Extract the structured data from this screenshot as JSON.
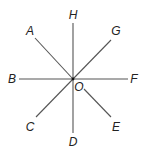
{
  "diagram": {
    "type": "rays-from-common-point",
    "center": {
      "label": "O",
      "x": 73,
      "y": 79
    },
    "colors": {
      "line": "#555555",
      "label": "#222222",
      "background": "#ffffff"
    },
    "rays": [
      {
        "label": "H",
        "direction": "up",
        "x1": 73,
        "y1": 79,
        "x2": 73,
        "y2": 23,
        "lx": 73,
        "ly": 15
      },
      {
        "label": "G",
        "direction": "up-right",
        "x1": 73,
        "y1": 79,
        "x2": 111,
        "y2": 40,
        "lx": 116,
        "ly": 31
      },
      {
        "label": "F",
        "direction": "right",
        "x1": 73,
        "y1": 79,
        "x2": 128,
        "y2": 79,
        "lx": 134,
        "ly": 79
      },
      {
        "label": "E",
        "direction": "down-right",
        "x1": 84,
        "y1": 89,
        "x2": 111,
        "y2": 117,
        "lx": 116,
        "ly": 127
      },
      {
        "label": "D",
        "direction": "down",
        "x1": 73,
        "y1": 79,
        "x2": 73,
        "y2": 133,
        "lx": 73,
        "ly": 142
      },
      {
        "label": "C",
        "direction": "down-left",
        "x1": 73,
        "y1": 79,
        "x2": 36,
        "y2": 117,
        "lx": 30,
        "ly": 127
      },
      {
        "label": "B",
        "direction": "left",
        "x1": 73,
        "y1": 79,
        "x2": 19,
        "y2": 79,
        "lx": 12,
        "ly": 79
      },
      {
        "label": "A",
        "direction": "up-left",
        "x1": 73,
        "y1": 79,
        "x2": 35,
        "y2": 38,
        "lx": 30,
        "ly": 31
      }
    ],
    "center_label_pos": {
      "x": 79,
      "y": 87
    }
  }
}
